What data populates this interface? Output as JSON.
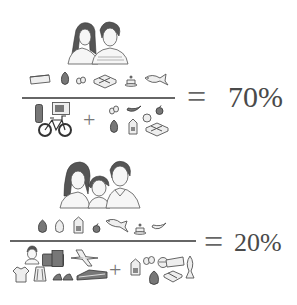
{
  "figure_1": {
    "label": "couple-household",
    "people": [
      "woman",
      "man"
    ],
    "numerator_items": [
      "bread-loaf",
      "cabbage",
      "eggs",
      "tofu-blocks",
      "cake",
      "fish"
    ],
    "denominator_left_items": [
      "thermos",
      "microwave",
      "bicycle"
    ],
    "operator": "+",
    "denominator_right_items": [
      "eggs",
      "banana",
      "apple",
      "bun",
      "cabbage",
      "milk-carton",
      "tofu-blocks"
    ],
    "equals": "=",
    "result": "70%"
  },
  "figure_2": {
    "label": "family-of-three-household",
    "people": [
      "mother",
      "child",
      "father"
    ],
    "numerator_items": [
      "cabbage",
      "chicken",
      "milk-carton",
      "apple",
      "fish",
      "cake",
      "banana"
    ],
    "denominator_left_items": [
      "boy",
      "suitcase",
      "airplane",
      "t-shirt",
      "skirt",
      "shoes",
      "shoe-box"
    ],
    "operator": "+",
    "denominator_right_items": [
      "milk-carton",
      "eggs",
      "bowl",
      "bread-loaf",
      "fish",
      "cabbage",
      "tofu-blocks"
    ],
    "equals": "=",
    "result": "20%"
  }
}
